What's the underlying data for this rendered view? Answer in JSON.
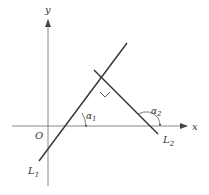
{
  "diagram": {
    "type": "geometry",
    "axes": {
      "x_label": "x",
      "y_label": "y",
      "origin_label": "O"
    },
    "lines": [
      {
        "name": "L",
        "subscript": "1",
        "angle_label": "α",
        "angle_subscript": "1"
      },
      {
        "name": "L",
        "subscript": "2",
        "angle_label": "α",
        "angle_subscript": "2"
      }
    ],
    "right_angle_marker": true,
    "colors": {
      "axis": "#888888",
      "line": "#333333",
      "text": "#333333"
    }
  }
}
